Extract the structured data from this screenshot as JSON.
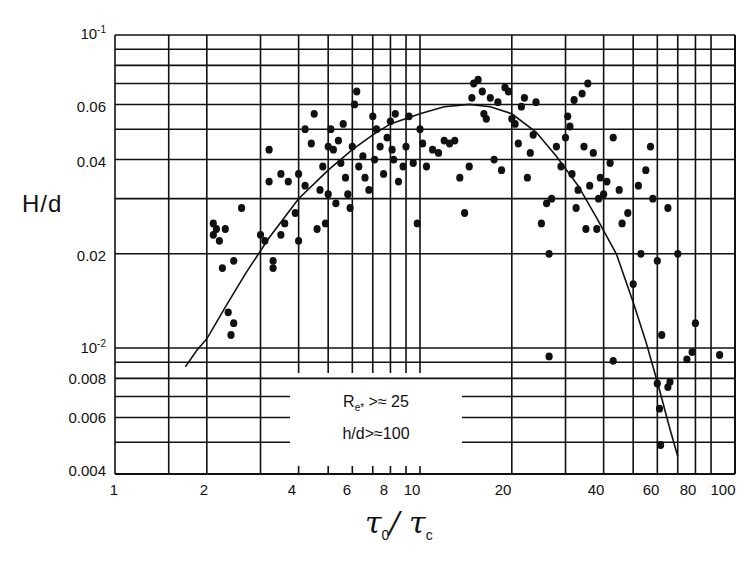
{
  "chart_data": {
    "type": "scatter",
    "title": "",
    "xlabel": "τ0 / τc",
    "ylabel": "H/d",
    "xscale": "log",
    "yscale": "log",
    "xlim": [
      1,
      100
    ],
    "ylim": [
      0.004,
      0.1
    ],
    "grid": true,
    "x_ticks": [
      "1",
      "2",
      "4",
      "6",
      "8",
      "10",
      "20",
      "40",
      "60",
      "80",
      "100"
    ],
    "y_ticks": [
      "10^-1",
      "0.06",
      "0.04",
      "0.02",
      "10^-2",
      "0.008",
      "0.006",
      "0.004"
    ],
    "annotation": [
      "R_e* >≈ 25",
      "h/d >≈ 100"
    ],
    "series": [
      {
        "name": "observed",
        "kind": "points",
        "points": [
          [
            2.1,
            0.025
          ],
          [
            2.1,
            0.023
          ],
          [
            2.15,
            0.024
          ],
          [
            2.2,
            0.022
          ],
          [
            2.25,
            0.018
          ],
          [
            2.3,
            0.024
          ],
          [
            2.45,
            0.019
          ],
          [
            2.6,
            0.028
          ],
          [
            2.35,
            0.013
          ],
          [
            2.4,
            0.011
          ],
          [
            2.45,
            0.012
          ],
          [
            3.0,
            0.023
          ],
          [
            3.1,
            0.022
          ],
          [
            3.2,
            0.034
          ],
          [
            3.2,
            0.043
          ],
          [
            3.3,
            0.019
          ],
          [
            3.3,
            0.018
          ],
          [
            3.5,
            0.023
          ],
          [
            3.6,
            0.025
          ],
          [
            3.5,
            0.036
          ],
          [
            3.7,
            0.034
          ],
          [
            3.9,
            0.027
          ],
          [
            4.0,
            0.022
          ],
          [
            4.0,
            0.036
          ],
          [
            4.2,
            0.033
          ],
          [
            4.2,
            0.05
          ],
          [
            4.4,
            0.045
          ],
          [
            4.5,
            0.056
          ],
          [
            4.6,
            0.024
          ],
          [
            4.7,
            0.032
          ],
          [
            4.8,
            0.038
          ],
          [
            4.9,
            0.025
          ],
          [
            5.0,
            0.031
          ],
          [
            5.0,
            0.044
          ],
          [
            5.1,
            0.05
          ],
          [
            5.2,
            0.043
          ],
          [
            5.3,
            0.029
          ],
          [
            5.4,
            0.046
          ],
          [
            5.5,
            0.039
          ],
          [
            5.6,
            0.052
          ],
          [
            5.7,
            0.035
          ],
          [
            5.8,
            0.031
          ],
          [
            5.9,
            0.028
          ],
          [
            6.0,
            0.044
          ],
          [
            6.1,
            0.06
          ],
          [
            6.2,
            0.066
          ],
          [
            6.3,
            0.038
          ],
          [
            6.5,
            0.041
          ],
          [
            6.6,
            0.035
          ],
          [
            6.8,
            0.032
          ],
          [
            7.0,
            0.055
          ],
          [
            7.1,
            0.04
          ],
          [
            7.2,
            0.05
          ],
          [
            7.4,
            0.044
          ],
          [
            7.6,
            0.036
          ],
          [
            7.8,
            0.047
          ],
          [
            8.0,
            0.053
          ],
          [
            8.1,
            0.043
          ],
          [
            8.2,
            0.04
          ],
          [
            8.3,
            0.056
          ],
          [
            8.5,
            0.034
          ],
          [
            8.8,
            0.038
          ],
          [
            9.0,
            0.044
          ],
          [
            9.2,
            0.055
          ],
          [
            9.5,
            0.039
          ],
          [
            9.8,
            0.025
          ],
          [
            10.0,
            0.05
          ],
          [
            10.2,
            0.045
          ],
          [
            10.5,
            0.038
          ],
          [
            11.0,
            0.043
          ],
          [
            11.5,
            0.042
          ],
          [
            12.0,
            0.046
          ],
          [
            12.5,
            0.045
          ],
          [
            13.0,
            0.046
          ],
          [
            13.5,
            0.035
          ],
          [
            14.0,
            0.027
          ],
          [
            14.5,
            0.038
          ],
          [
            14.8,
            0.063
          ],
          [
            15.0,
            0.07
          ],
          [
            15.5,
            0.072
          ],
          [
            16.0,
            0.066
          ],
          [
            16.2,
            0.056
          ],
          [
            16.5,
            0.054
          ],
          [
            17.0,
            0.063
          ],
          [
            17.5,
            0.04
          ],
          [
            18.0,
            0.061
          ],
          [
            18.5,
            0.037
          ],
          [
            19.0,
            0.068
          ],
          [
            19.5,
            0.066
          ],
          [
            20.0,
            0.054
          ],
          [
            20.5,
            0.052
          ],
          [
            21.0,
            0.045
          ],
          [
            21.5,
            0.059
          ],
          [
            22.0,
            0.063
          ],
          [
            22.5,
            0.035
          ],
          [
            23.0,
            0.042
          ],
          [
            23.5,
            0.048
          ],
          [
            24.0,
            0.061
          ],
          [
            25.0,
            0.025
          ],
          [
            26.0,
            0.029
          ],
          [
            26.5,
            0.02
          ],
          [
            27.0,
            0.03
          ],
          [
            28.0,
            0.044
          ],
          [
            29.0,
            0.038
          ],
          [
            30.0,
            0.047
          ],
          [
            30.5,
            0.055
          ],
          [
            31.0,
            0.051
          ],
          [
            31.5,
            0.036
          ],
          [
            32.0,
            0.062
          ],
          [
            32.5,
            0.028
          ],
          [
            33.0,
            0.032
          ],
          [
            34.0,
            0.065
          ],
          [
            34.5,
            0.044
          ],
          [
            35.0,
            0.024
          ],
          [
            35.5,
            0.07
          ],
          [
            36.0,
            0.033
          ],
          [
            37.0,
            0.042
          ],
          [
            38.0,
            0.024
          ],
          [
            38.5,
            0.03
          ],
          [
            39.0,
            0.035
          ],
          [
            40.0,
            0.031
          ],
          [
            41.0,
            0.034
          ],
          [
            42.0,
            0.039
          ],
          [
            43.0,
            0.047
          ],
          [
            45.0,
            0.032
          ],
          [
            46.0,
            0.025
          ],
          [
            48.0,
            0.027
          ],
          [
            50.0,
            0.016
          ],
          [
            52.0,
            0.033
          ],
          [
            53.0,
            0.02
          ],
          [
            55.0,
            0.037
          ],
          [
            57.0,
            0.044
          ],
          [
            58.0,
            0.03
          ],
          [
            60.0,
            0.019
          ],
          [
            62.0,
            0.011
          ],
          [
            65.0,
            0.028
          ],
          [
            70.0,
            0.02
          ],
          [
            75.0,
            0.0092
          ],
          [
            78.0,
            0.0097
          ],
          [
            80.0,
            0.012
          ],
          [
            65.0,
            0.0075
          ],
          [
            60.0,
            0.0077
          ],
          [
            66.0,
            0.0078
          ],
          [
            61.0,
            0.0064
          ],
          [
            61.5,
            0.0049
          ],
          [
            26.5,
            0.0094
          ],
          [
            43.0,
            0.0091
          ],
          [
            96.0,
            0.0095
          ]
        ]
      },
      {
        "name": "fitted curve",
        "kind": "line",
        "points": [
          [
            1.7,
            0.0087
          ],
          [
            1.85,
            0.0098
          ],
          [
            2.0,
            0.0107
          ],
          [
            2.3,
            0.0135
          ],
          [
            2.7,
            0.0175
          ],
          [
            3.2,
            0.0225
          ],
          [
            4.0,
            0.03
          ],
          [
            5.0,
            0.037
          ],
          [
            6.0,
            0.043
          ],
          [
            7.0,
            0.048
          ],
          [
            8.0,
            0.052
          ],
          [
            10.0,
            0.056
          ],
          [
            12.0,
            0.059
          ],
          [
            14.5,
            0.06
          ],
          [
            17.0,
            0.059
          ],
          [
            20.0,
            0.056
          ],
          [
            24.0,
            0.049
          ],
          [
            28.0,
            0.041
          ],
          [
            33.0,
            0.033
          ],
          [
            38.0,
            0.026
          ],
          [
            44.0,
            0.02
          ],
          [
            50.0,
            0.014
          ],
          [
            55.0,
            0.0105
          ],
          [
            60.0,
            0.0078
          ],
          [
            66.0,
            0.0055
          ],
          [
            70.0,
            0.0045
          ]
        ]
      }
    ]
  },
  "axes": {
    "y_tick_labels": [
      {
        "text": "10",
        "sup": "-1",
        "top": 24
      },
      {
        "text": "0.06",
        "sup": "",
        "top": 98
      },
      {
        "text": "0.04",
        "sup": "",
        "top": 153
      },
      {
        "text": "0.02",
        "sup": "",
        "top": 247
      },
      {
        "text": "10",
        "sup": "-2",
        "top": 338
      },
      {
        "text": "0.008",
        "sup": "",
        "top": 370
      },
      {
        "text": "0.006",
        "sup": "",
        "top": 409
      },
      {
        "text": "0.004",
        "sup": "",
        "top": 462
      }
    ],
    "x_tick_labels": [
      {
        "text": "1",
        "left": 114
      },
      {
        "text": "2",
        "left": 204
      },
      {
        "text": "4",
        "left": 292
      },
      {
        "text": "6",
        "left": 347
      },
      {
        "text": "8",
        "left": 384
      },
      {
        "text": "10",
        "left": 412
      },
      {
        "text": "20",
        "left": 503
      },
      {
        "text": "40",
        "left": 596
      },
      {
        "text": "60",
        "left": 651
      },
      {
        "text": "80",
        "left": 688
      },
      {
        "text": "100",
        "left": 723
      }
    ],
    "y_title": "H/d",
    "x_title_main": "τ",
    "x_title_sub0": "0",
    "x_title_sep": "/ τ",
    "x_title_subc": "c"
  },
  "legend": {
    "line1_R": "R",
    "line1_sub": "e*",
    "line1_rest": " >≈ 25",
    "line2": "h/d>≈100"
  },
  "colors": {
    "ink": "#111111",
    "background": "#ffffff"
  }
}
